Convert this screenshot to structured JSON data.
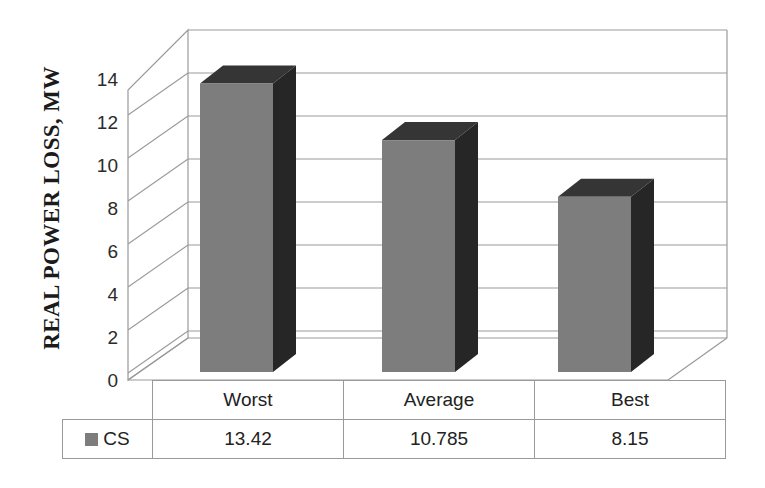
{
  "chart_data": {
    "type": "bar",
    "title": "",
    "subtitle": "",
    "xlabel": "",
    "ylabel": "REAL POWER LOSS, MW",
    "categories": [
      "Worst",
      "Average",
      "Best"
    ],
    "series": [
      {
        "name": "CS",
        "values": [
          13.42,
          10.785,
          8.15
        ],
        "value_labels": [
          "13.42",
          "10.785",
          "8.15"
        ],
        "color": "#7d7d7d",
        "side_color": "#262626",
        "top_color": "#353535"
      }
    ],
    "ylim": [
      0,
      16
    ],
    "y_ticks": [
      0,
      2,
      4,
      6,
      8,
      10,
      12,
      14
    ],
    "y_tick_labels": [
      "0",
      "2",
      "4",
      "6",
      "8",
      "10",
      "12",
      "14"
    ],
    "grid": true,
    "grid_color": "#9a9a9a",
    "legend_position": "data-table-left",
    "three_d": true,
    "data_table_visible": true
  },
  "axis": {
    "y_title": "REAL POWER LOSS, MW",
    "ticks": [
      {
        "label": "14",
        "value": 14
      },
      {
        "label": "12",
        "value": 12
      },
      {
        "label": "10",
        "value": 10
      },
      {
        "label": "8",
        "value": 8
      },
      {
        "label": "6",
        "value": 6
      },
      {
        "label": "4",
        "value": 4
      },
      {
        "label": "2",
        "value": 2
      },
      {
        "label": "0",
        "value": 0
      }
    ]
  },
  "legend": {
    "series_label": "CS",
    "swatch_color": "#7d7d7d"
  },
  "table": {
    "category_headers": [
      "Worst",
      "Average",
      "Best"
    ],
    "rows": [
      {
        "label": "CS",
        "cells": [
          "13.42",
          "10.785",
          "8.15"
        ]
      }
    ]
  }
}
